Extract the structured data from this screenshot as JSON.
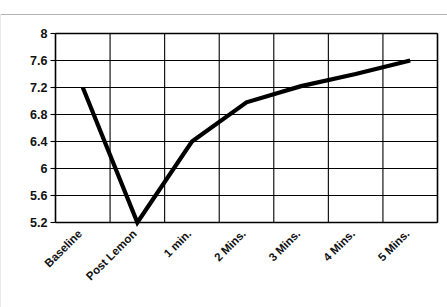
{
  "chart_data": {
    "type": "line",
    "title": "",
    "subtitle": "",
    "xlabel": "",
    "ylabel": "",
    "categories": [
      "Baseline",
      "Post Lemon",
      "1 min.",
      "2 Mins.",
      "3 Mins.",
      "4 Mins.",
      "5 Mins."
    ],
    "series": [
      {
        "name": "pH",
        "values": [
          7.2,
          5.2,
          6.4,
          6.98,
          7.22,
          7.4,
          7.6
        ],
        "color": "#000000"
      }
    ],
    "ylim": [
      5.2,
      8.0
    ],
    "y_ticks": [
      5.2,
      5.6,
      6,
      6.4,
      6.8,
      7.2,
      7.6,
      8
    ],
    "y_tick_labels": [
      "5.2",
      "5.6",
      "6",
      "6.4",
      "6.8",
      "7.2",
      "7.6",
      "8"
    ],
    "grid": true,
    "grid_color": "#000000",
    "legend": false,
    "legend_position": "none",
    "x_tick_rotation": -45,
    "background_color": "#ffffff",
    "axis_color": "#000000",
    "annotations": []
  }
}
